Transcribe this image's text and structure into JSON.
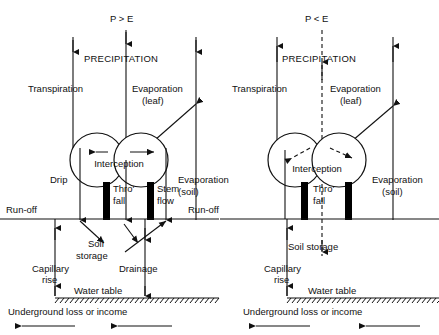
{
  "figure": {
    "type": "hydrological-cycle-diagram",
    "title": "",
    "background_color": "#ffffff",
    "line_color": "#111111"
  },
  "panels": [
    {
      "id": "left",
      "condition_label": "P > E",
      "condition_desc": "precipitation greater than evaporation",
      "precipitation_label": "PRECIPITATION",
      "flux_labels": {
        "transpiration": "Transpiration",
        "evaporation_leaf_line1": "Evaporation",
        "evaporation_leaf_line2": "(leaf)",
        "interception": "Interception",
        "drip": "Drip",
        "thro_fall_line1": "Thro'",
        "thro_fall_line2": "fall",
        "stem_flow_line1": "Stem",
        "stem_flow_line2": "flow",
        "evaporation_soil_line1": "Evaporation",
        "evaporation_soil_line2": "(soil)",
        "run_off_left": "Run-off",
        "run_off_right": "Run-off",
        "soil_storage_line1": "Soil",
        "soil_storage_line2": "storage",
        "capillary_rise_line1": "Capillary",
        "capillary_rise_line2": "rise",
        "drainage": "Drainage",
        "water_table": "Water table",
        "underground": "Underground loss or income"
      },
      "line_style": "solid",
      "precipitation_arrow_direction": "down",
      "transpiration_arrow_direction": "down",
      "soil_storage_arrow_direction": "down",
      "has_drip": true,
      "has_stem_flow": true,
      "has_drainage": true
    },
    {
      "id": "right",
      "condition_label": "P < E",
      "condition_desc": "precipitation less than evaporation",
      "precipitation_label": "PRECIPITATION",
      "flux_labels": {
        "transpiration": "Transpiration",
        "evaporation_leaf_line1": "Evaporation",
        "evaporation_leaf_line2": "(leaf)",
        "interception": "Interception",
        "thro_fall_line1": "Thro'",
        "thro_fall_line2": "fall",
        "evaporation_soil_line1": "Evaporation",
        "evaporation_soil_line2": "(soil)",
        "soil_storage": "Soil storage",
        "capillary_rise_line1": "Capillary",
        "capillary_rise_line2": "rise",
        "water_table": "Water table",
        "underground": "Underground loss or income"
      },
      "line_style": "dashed-center",
      "precipitation_arrow_direction": "up",
      "transpiration_arrow_direction": "up",
      "soil_storage_arrow_direction": "down",
      "has_drip": false,
      "has_stem_flow": false,
      "has_drainage": false
    }
  ]
}
